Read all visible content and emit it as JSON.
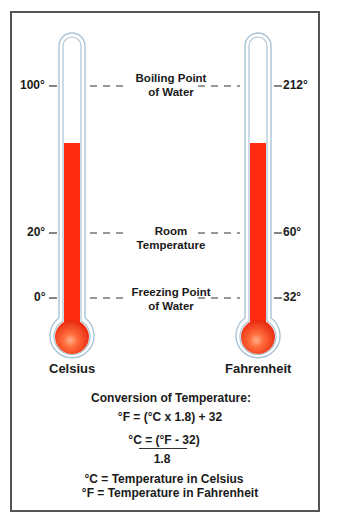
{
  "colors": {
    "frame": "#555555",
    "tube_outline": "#a9c3d6",
    "mercury": "#ff2a10",
    "bulb_highlight": "#ffb08a",
    "dash": "#333333"
  },
  "thermometers": [
    {
      "name": "Celsius",
      "ticks": [
        {
          "label": "100°",
          "value": 100
        },
        {
          "label": "20°",
          "value": 20
        },
        {
          "label": "0°",
          "value": 0
        }
      ]
    },
    {
      "name": "Fahrenheit",
      "ticks": [
        {
          "label": "212°",
          "value": 212
        },
        {
          "label": "60°",
          "value": 60
        },
        {
          "label": "32°",
          "value": 32
        }
      ]
    }
  ],
  "reference_points": [
    {
      "line1": "Boiling Point",
      "line2": "of Water"
    },
    {
      "line1": "Room",
      "line2": "Temperature"
    },
    {
      "line1": "Freezing Point",
      "line2": "of Water"
    }
  ],
  "conversion": {
    "title": "Conversion of Temperature:",
    "formula_f": "°F = (°C x 1.8) + 32",
    "formula_c_numerator": "°C = (°F - 32)",
    "formula_c_denominator": "1.8",
    "legend_c": "°C = Temperature in Celsius",
    "legend_f": "°F = Temperature in Fahrenheit"
  }
}
